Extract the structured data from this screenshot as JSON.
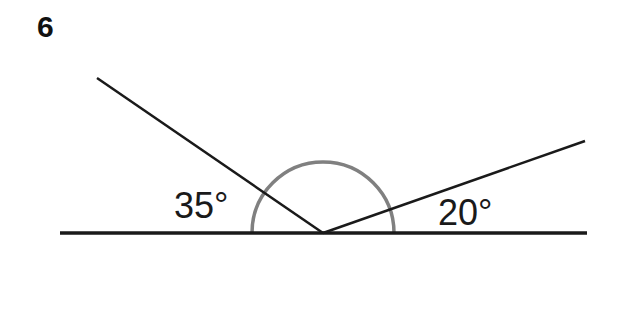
{
  "question_number": "6",
  "angles": [
    {
      "label": "35°",
      "value": 35,
      "side": "left"
    },
    {
      "label": "20°",
      "value": 20,
      "side": "right"
    }
  ],
  "colors": {
    "lines": "#1a1a1a",
    "arc": "#808080",
    "text": "#1a1a1a"
  }
}
